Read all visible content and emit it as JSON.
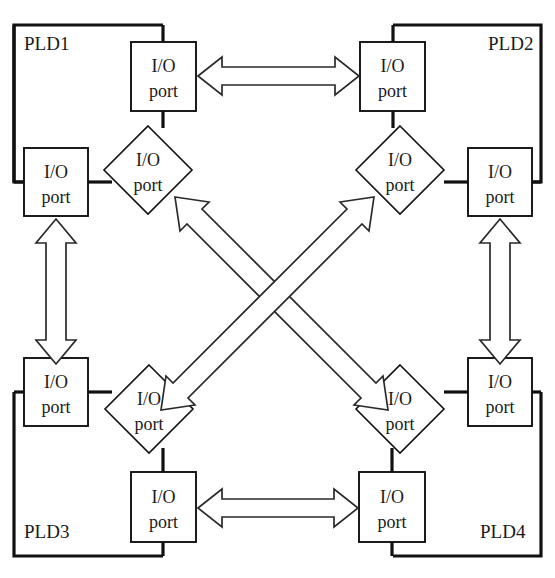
{
  "diagram": {
    "colors": {
      "background": "#ffffff",
      "stroke": "#111111",
      "arrow_stroke": "#2a2a2a",
      "text": "#1a1a1a"
    },
    "io_port_label_line1": "I/O",
    "io_port_label_line2": "port",
    "plds": [
      {
        "id": "pld1",
        "label": "PLD1",
        "corner": "top-left"
      },
      {
        "id": "pld2",
        "label": "PLD2",
        "corner": "top-right"
      },
      {
        "id": "pld3",
        "label": "PLD3",
        "corner": "bottom-left"
      },
      {
        "id": "pld4",
        "label": "PLD4",
        "corner": "bottom-right"
      }
    ],
    "ports": [
      {
        "id": "pld1-top-port",
        "pld": "PLD1",
        "shape": "rect",
        "label1": "I/O",
        "label2": "port"
      },
      {
        "id": "pld1-left-port",
        "pld": "PLD1",
        "shape": "rect",
        "label1": "I/O",
        "label2": "port"
      },
      {
        "id": "pld1-diag-port",
        "pld": "PLD1",
        "shape": "diamond",
        "label1": "I/O",
        "label2": "port"
      },
      {
        "id": "pld2-top-port",
        "pld": "PLD2",
        "shape": "rect",
        "label1": "I/O",
        "label2": "port"
      },
      {
        "id": "pld2-right-port",
        "pld": "PLD2",
        "shape": "rect",
        "label1": "I/O",
        "label2": "port"
      },
      {
        "id": "pld2-diag-port",
        "pld": "PLD2",
        "shape": "diamond",
        "label1": "I/O",
        "label2": "port"
      },
      {
        "id": "pld3-left-port",
        "pld": "PLD3",
        "shape": "rect",
        "label1": "I/O",
        "label2": "port"
      },
      {
        "id": "pld3-bottom-port",
        "pld": "PLD3",
        "shape": "rect",
        "label1": "I/O",
        "label2": "port"
      },
      {
        "id": "pld3-diag-port",
        "pld": "PLD3",
        "shape": "diamond",
        "label1": "I/O",
        "label2": "port"
      },
      {
        "id": "pld4-right-port",
        "pld": "PLD4",
        "shape": "rect",
        "label1": "I/O",
        "label2": "port"
      },
      {
        "id": "pld4-bottom-port",
        "pld": "PLD4",
        "shape": "rect",
        "label1": "I/O",
        "label2": "port"
      },
      {
        "id": "pld4-diag-port",
        "pld": "PLD4",
        "shape": "diamond",
        "label1": "I/O",
        "label2": "port"
      }
    ],
    "links": [
      {
        "id": "link-pld1-pld2",
        "from": "PLD1",
        "to": "PLD2",
        "style": "bidirectional",
        "orientation": "horizontal"
      },
      {
        "id": "link-pld3-pld4",
        "from": "PLD3",
        "to": "PLD4",
        "style": "bidirectional",
        "orientation": "horizontal"
      },
      {
        "id": "link-pld1-pld3",
        "from": "PLD1",
        "to": "PLD3",
        "style": "bidirectional",
        "orientation": "vertical"
      },
      {
        "id": "link-pld2-pld4",
        "from": "PLD2",
        "to": "PLD4",
        "style": "bidirectional",
        "orientation": "vertical"
      },
      {
        "id": "link-pld1-pld4",
        "from": "PLD1",
        "to": "PLD4",
        "style": "bidirectional",
        "orientation": "diagonal"
      },
      {
        "id": "link-pld2-pld3",
        "from": "PLD2",
        "to": "PLD3",
        "style": "bidirectional",
        "orientation": "diagonal"
      }
    ]
  }
}
